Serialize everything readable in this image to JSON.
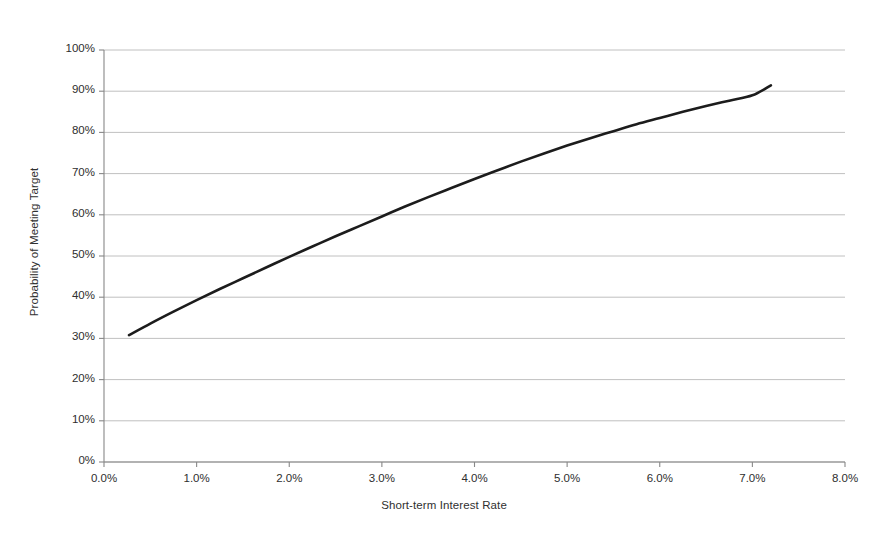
{
  "chart_data": {
    "type": "line",
    "title": "",
    "xlabel": "Short-term Interest Rate",
    "ylabel": "Probability of Meeting Target",
    "xlim": [
      0,
      8
    ],
    "ylim": [
      0,
      100
    ],
    "grid": true,
    "legend": "none",
    "x_unit": "%",
    "y_unit": "%",
    "xticks": [
      "0.0%",
      "1.0%",
      "2.0%",
      "3.0%",
      "4.0%",
      "5.0%",
      "6.0%",
      "7.0%",
      "8.0%"
    ],
    "xtick_values": [
      0,
      1,
      2,
      3,
      4,
      5,
      6,
      7,
      8
    ],
    "yticks": [
      "0%",
      "10%",
      "20%",
      "30%",
      "40%",
      "50%",
      "60%",
      "70%",
      "80%",
      "90%",
      "100%"
    ],
    "ytick_values": [
      0,
      10,
      20,
      30,
      40,
      50,
      60,
      70,
      80,
      90,
      100
    ],
    "series": [
      {
        "name": "Probability of Meeting Target",
        "color": "#1c1c1c",
        "line_width": 2.6,
        "x": [
          0.27,
          0.5,
          0.75,
          1.0,
          1.25,
          1.5,
          1.75,
          2.0,
          2.25,
          2.5,
          2.75,
          3.0,
          3.25,
          3.5,
          3.75,
          4.0,
          4.25,
          4.5,
          4.75,
          5.0,
          5.25,
          5.5,
          5.75,
          6.0,
          6.25,
          6.5,
          6.75,
          7.0,
          7.2
        ],
        "values": [
          30.8,
          33.6,
          36.5,
          39.3,
          42.0,
          44.6,
          47.2,
          49.8,
          52.3,
          54.8,
          57.2,
          59.6,
          62.0,
          64.3,
          66.5,
          68.7,
          70.8,
          72.9,
          74.9,
          76.8,
          78.6,
          80.3,
          82.0,
          83.5,
          85.0,
          86.4,
          87.7,
          89.0,
          91.4
        ]
      }
    ]
  },
  "axes": {
    "x_title": "Short-term Interest Rate",
    "y_title": "Probability of Meeting Target"
  },
  "colors": {
    "line": "#1c1c1c",
    "grid": "#b9b9b9",
    "axis": "#888888",
    "background": "#ffffff"
  }
}
